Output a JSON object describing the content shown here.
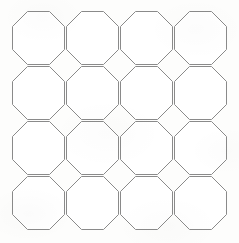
{
  "figure": {
    "type": "geometric-tiling-diagram",
    "shape_name": "octagon",
    "rows": 4,
    "columns": 4,
    "tile_count": 16,
    "background_color": "#fdfdfc",
    "stroke_color": "#8a8a8a",
    "fill_color": "#ffffff",
    "stroke_width_px": 1
  },
  "geometry": {
    "canvas_width_px": 239,
    "canvas_height_px": 243,
    "origin_x_px": 12,
    "origin_y_px": 11,
    "pitch_x_px": 54,
    "pitch_y_px": 55,
    "tile_width_px": 52,
    "tile_height_px": 53,
    "corner_chamfer_px": 15,
    "gap_px": 2
  },
  "tiles": [
    {
      "id": "octagon-r1-c1",
      "row": 1,
      "column": 1,
      "x": 12,
      "y": 11
    },
    {
      "id": "octagon-r1-c2",
      "row": 1,
      "column": 2,
      "x": 66,
      "y": 11
    },
    {
      "id": "octagon-r1-c3",
      "row": 1,
      "column": 3,
      "x": 120,
      "y": 11
    },
    {
      "id": "octagon-r1-c4",
      "row": 1,
      "column": 4,
      "x": 174,
      "y": 11
    },
    {
      "id": "octagon-r2-c1",
      "row": 2,
      "column": 1,
      "x": 12,
      "y": 66
    },
    {
      "id": "octagon-r2-c2",
      "row": 2,
      "column": 2,
      "x": 66,
      "y": 66
    },
    {
      "id": "octagon-r2-c3",
      "row": 2,
      "column": 3,
      "x": 120,
      "y": 66
    },
    {
      "id": "octagon-r2-c4",
      "row": 2,
      "column": 4,
      "x": 174,
      "y": 66
    },
    {
      "id": "octagon-r3-c1",
      "row": 3,
      "column": 1,
      "x": 12,
      "y": 121
    },
    {
      "id": "octagon-r3-c2",
      "row": 3,
      "column": 2,
      "x": 66,
      "y": 121
    },
    {
      "id": "octagon-r3-c3",
      "row": 3,
      "column": 3,
      "x": 120,
      "y": 121
    },
    {
      "id": "octagon-r3-c4",
      "row": 3,
      "column": 4,
      "x": 174,
      "y": 121
    },
    {
      "id": "octagon-r4-c1",
      "row": 4,
      "column": 1,
      "x": 12,
      "y": 176
    },
    {
      "id": "octagon-r4-c2",
      "row": 4,
      "column": 2,
      "x": 66,
      "y": 176
    },
    {
      "id": "octagon-r4-c3",
      "row": 4,
      "column": 3,
      "x": 120,
      "y": 176
    },
    {
      "id": "octagon-r4-c4",
      "row": 4,
      "column": 4,
      "x": 174,
      "y": 176
    }
  ]
}
